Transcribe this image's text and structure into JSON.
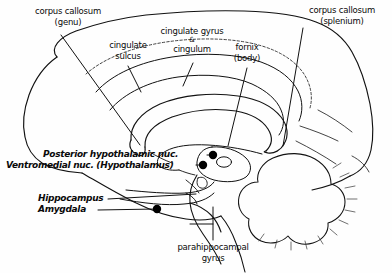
{
  "figure": {
    "background_color": "#fefefe",
    "ink_color": "#111111",
    "marker_color": "#000000"
  },
  "labels": {
    "corpus_callosum_genu": {
      "line1": "corpus callosum",
      "line2": "(genu)"
    },
    "cingulate_sulcus": {
      "line1": "cingulate",
      "line2": "sulcus"
    },
    "cingulate_gyrus": {
      "line1": "cingulate gyrus",
      "amp": "&",
      "line2": "cingulum"
    },
    "fornix_body": {
      "line1": "fornix",
      "line2": "(body)"
    },
    "corpus_callosum_splenium": {
      "line1": "corpus callosum",
      "line2": "(splenium)"
    },
    "posterior_hypothalamic_nucleus": {
      "text": "Posterior  hypothalamic nuc."
    },
    "ventromedial_nucleus": {
      "text": "Ventromedial nuc. (Hypothalamus)"
    },
    "hippocampus": {
      "text": "Hippocampus"
    },
    "amygdala": {
      "text": "Amygdala"
    },
    "parahippocampal_gyrus": {
      "line1": "parahippocampal",
      "line2": "gyrus"
    }
  },
  "markers": [
    {
      "name": "posterior-hypothalamic-nucleus-dot",
      "x": 213,
      "y": 155
    },
    {
      "name": "ventromedial-nucleus-dot",
      "x": 203,
      "y": 165
    },
    {
      "name": "amygdala-dot",
      "x": 157,
      "y": 209
    }
  ]
}
